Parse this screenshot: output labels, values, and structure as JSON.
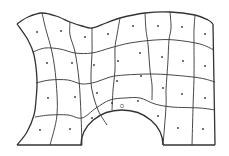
{
  "diagram": {
    "title": "Structured quadrilateral mesh with semicircular cutout",
    "type": "mesh",
    "grid": {
      "columns": 8,
      "rows": 4
    },
    "colors": {
      "line": "#333333",
      "node": "#333333",
      "background": "#ffffff"
    },
    "boundary": {
      "top": [
        [
          17,
          24
        ],
        [
          28,
          17
        ],
        [
          42,
          13
        ],
        [
          56,
          16
        ],
        [
          70,
          22
        ],
        [
          82,
          26
        ],
        [
          92,
          28
        ],
        [
          106,
          23
        ],
        [
          120,
          18
        ],
        [
          145,
          13
        ],
        [
          170,
          12
        ],
        [
          195,
          15
        ],
        [
          208,
          20
        ],
        [
          213,
          24
        ]
      ],
      "left": [
        [
          17,
          24
        ],
        [
          28,
          40
        ],
        [
          34,
          55
        ],
        [
          37,
          80
        ],
        [
          36,
          100
        ],
        [
          34,
          115
        ],
        [
          27,
          132
        ],
        [
          17,
          145
        ]
      ],
      "bottom_left": [
        [
          17,
          145
        ],
        [
          82,
          145
        ]
      ],
      "arc": {
        "cx": 122,
        "cy": 145,
        "rx": 41,
        "ry": 35
      },
      "bottom_right": [
        [
          163,
          145
        ],
        [
          215,
          145
        ]
      ],
      "right": [
        [
          213,
          24
        ],
        [
          215,
          145
        ]
      ]
    },
    "row_lines": [
      [
        [
          33,
          52
        ],
        [
          45,
          48
        ],
        [
          60,
          49
        ],
        [
          75,
          53
        ],
        [
          92,
          53
        ],
        [
          110,
          48
        ],
        [
          130,
          43
        ],
        [
          155,
          40
        ],
        [
          175,
          40
        ],
        [
          200,
          44
        ],
        [
          214,
          50
        ]
      ],
      [
        [
          36,
          83
        ],
        [
          50,
          80
        ],
        [
          68,
          80
        ],
        [
          82,
          84
        ],
        [
          96,
          82
        ],
        [
          110,
          77
        ],
        [
          125,
          75
        ],
        [
          150,
          74
        ],
        [
          172,
          75
        ],
        [
          200,
          78
        ],
        [
          215,
          82
        ]
      ],
      [
        [
          35,
          117
        ],
        [
          50,
          115
        ],
        [
          68,
          115
        ],
        [
          82,
          118
        ],
        [
          96,
          108
        ],
        [
          110,
          100
        ],
        [
          125,
          98
        ],
        [
          140,
          98
        ],
        [
          155,
          104
        ],
        [
          172,
          107
        ],
        [
          200,
          108
        ],
        [
          215,
          110
        ]
      ]
    ],
    "column_lines": [
      [
        [
          42,
          13
        ],
        [
          46,
          30
        ],
        [
          52,
          52
        ],
        [
          56,
          80
        ],
        [
          57,
          115
        ],
        [
          50,
          145
        ]
      ],
      [
        [
          70,
          22
        ],
        [
          70,
          35
        ],
        [
          75,
          52
        ],
        [
          79,
          80
        ],
        [
          81,
          115
        ],
        [
          82,
          145
        ]
      ],
      [
        [
          92,
          28
        ],
        [
          92,
          40
        ],
        [
          92,
          53
        ],
        [
          91,
          75
        ],
        [
          92,
          90
        ],
        [
          98,
          110
        ],
        [
          107,
          125
        ]
      ],
      [
        [
          120,
          18
        ],
        [
          117,
          35
        ],
        [
          115,
          48
        ],
        [
          115,
          70
        ],
        [
          113,
          90
        ],
        [
          112,
          110
        ]
      ],
      [
        [
          145,
          13
        ],
        [
          146,
          30
        ],
        [
          148,
          44
        ],
        [
          150,
          70
        ],
        [
          152,
          85
        ],
        [
          152,
          100
        ]
      ],
      [
        [
          170,
          12
        ],
        [
          171,
          28
        ],
        [
          169,
          40
        ],
        [
          168,
          60
        ],
        [
          167,
          75
        ],
        [
          166,
          90
        ],
        [
          166,
          107
        ],
        [
          163,
          145
        ]
      ],
      [
        [
          195,
          15
        ],
        [
          194,
          30
        ],
        [
          194,
          44
        ],
        [
          194,
          78
        ],
        [
          193,
          108
        ],
        [
          192,
          145
        ]
      ]
    ],
    "nodes": [
      [
        37,
        32
      ],
      [
        61,
        31
      ],
      [
        85,
        37
      ],
      [
        108,
        34
      ],
      [
        133,
        26
      ],
      [
        158,
        26
      ],
      [
        182,
        27
      ],
      [
        205,
        34
      ],
      [
        47,
        63
      ],
      [
        72,
        63
      ],
      [
        94,
        65
      ],
      [
        118,
        61
      ],
      [
        140,
        53
      ],
      [
        162,
        57
      ],
      [
        183,
        61
      ],
      [
        205,
        66
      ],
      [
        48,
        98
      ],
      [
        75,
        97
      ],
      [
        97,
        93
      ],
      [
        117,
        81
      ],
      [
        141,
        76
      ],
      [
        163,
        88
      ],
      [
        182,
        94
      ],
      [
        205,
        98
      ],
      [
        40,
        130
      ],
      [
        70,
        129
      ],
      [
        92,
        118
      ],
      [
        112,
        103
      ],
      [
        138,
        101
      ],
      [
        158,
        116
      ],
      [
        178,
        128
      ],
      [
        203,
        129
      ]
    ],
    "annotation": {
      "label": "O",
      "x": 122,
      "y": 108
    }
  }
}
